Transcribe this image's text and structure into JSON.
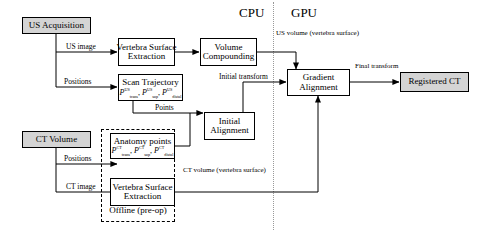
{
  "diagram": {
    "compute_sections": [
      {
        "id": "cpu",
        "label": "CPU"
      },
      {
        "id": "gpu",
        "label": "GPU"
      }
    ],
    "nodes": [
      {
        "id": "us-acquisition",
        "label": "US Acquisition",
        "style": "shaded"
      },
      {
        "id": "ct-volume",
        "label": "CT Volume",
        "style": "shaded"
      },
      {
        "id": "vertebra-surface-extraction-us",
        "line1": "Vertebra Surface",
        "line2": "Extraction",
        "style": "plain"
      },
      {
        "id": "volume-compounding",
        "line1": "Volume",
        "line2": "Compounding",
        "style": "plain"
      },
      {
        "id": "scan-trajectory",
        "line1": "Scan Trajectory",
        "formula": "P_trans^US, P_sup^US, P_distal^US",
        "style": "plain"
      },
      {
        "id": "initial-alignment",
        "line1": "Initial",
        "line2": "Alignment",
        "style": "plain"
      },
      {
        "id": "anatomy-points",
        "line1": "Anatomy points",
        "formula": "P_trans^CT, P_sup^CT, P_distal^CT",
        "style": "plain"
      },
      {
        "id": "vertebra-surface-extraction-ct",
        "line1": "Vertebra Surface",
        "line2": "Extraction",
        "style": "plain"
      },
      {
        "id": "gradient-alignment",
        "line1": "Gradient",
        "line2": "Alignment",
        "style": "plain"
      },
      {
        "id": "registered-ct",
        "label": "Registered CT",
        "style": "shaded"
      }
    ],
    "group": {
      "id": "offline-group",
      "label": "Offline (pre-op)"
    },
    "edge_labels": [
      {
        "id": "us-image",
        "text": "US image"
      },
      {
        "id": "positions-us",
        "text": "Positions"
      },
      {
        "id": "positions-ct",
        "text": "Positions"
      },
      {
        "id": "ct-image",
        "text": "CT image"
      },
      {
        "id": "points",
        "text": "Points"
      },
      {
        "id": "initial-transform",
        "text": "Initial transform"
      },
      {
        "id": "final-transform-line1",
        "text": "Final"
      },
      {
        "id": "final-transform-line2",
        "text": "transform"
      },
      {
        "id": "us-volume-line1",
        "text": "US volume"
      },
      {
        "id": "us-volume-line2",
        "text": "(vertebra surface)"
      },
      {
        "id": "ct-volume-out-line1",
        "text": "CT volume"
      },
      {
        "id": "ct-volume-out-line2",
        "text": "(vertebra surface)"
      }
    ],
    "symbols": {
      "P": "P",
      "sub_trans": "trans",
      "sub_sup": "sup",
      "sub_distal": "distal",
      "sup_us": "US",
      "sup_ct": "CT",
      "comma": ", "
    }
  }
}
